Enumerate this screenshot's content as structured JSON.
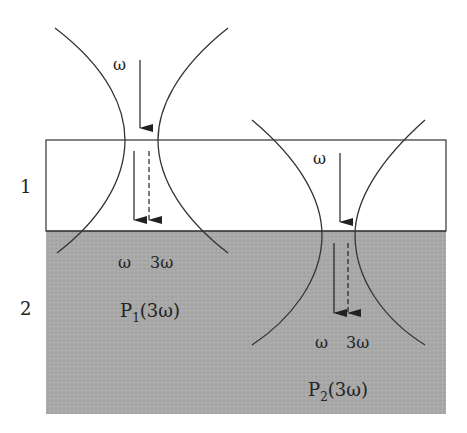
{
  "diagram": {
    "layers": [
      {
        "label": "1",
        "fill": "#ffffff"
      },
      {
        "label": "2",
        "fill": "#a8a8a8"
      }
    ],
    "beams": [
      {
        "name": "beam-1",
        "incident_label": "ω",
        "transmitted_labels": {
          "fundamental": "ω",
          "harmonic": "3ω"
        },
        "polarization_label": {
          "main": "P",
          "sub": "1",
          "arg": "(3ω)"
        }
      },
      {
        "name": "beam-2",
        "incident_label": "ω",
        "transmitted_labels": {
          "fundamental": "ω",
          "harmonic": "3ω"
        },
        "polarization_label": {
          "main": "P",
          "sub": "2",
          "arg": "(3ω)"
        }
      }
    ],
    "colors": {
      "line": "#333333",
      "substrate": "#a8a8a8"
    }
  }
}
